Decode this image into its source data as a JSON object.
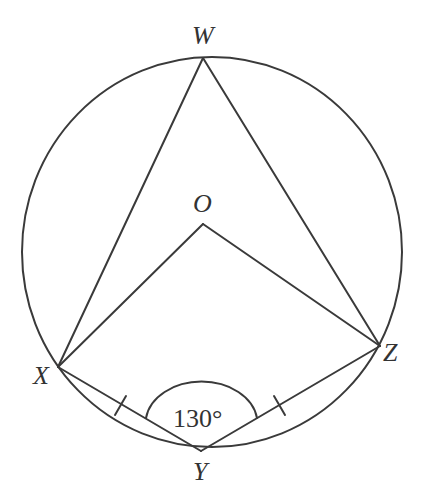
{
  "diagram": {
    "type": "circle-geometry",
    "circle": {
      "center_label": "O"
    },
    "points": {
      "W": {
        "label": "W"
      },
      "O": {
        "label": "O"
      },
      "X": {
        "label": "X"
      },
      "Y": {
        "label": "Y"
      },
      "Z": {
        "label": "Z"
      }
    },
    "segments": [
      "WX",
      "WZ",
      "OX",
      "OZ",
      "XY",
      "YZ"
    ],
    "equal_marks": [
      "XY",
      "YZ"
    ],
    "angle": {
      "vertex": "Y",
      "label": "130°"
    },
    "colors": {
      "stroke": "#3a3a3a",
      "text": "#333333",
      "background": "#ffffff"
    }
  }
}
